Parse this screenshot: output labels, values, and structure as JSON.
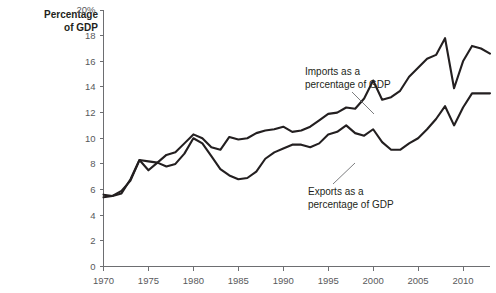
{
  "chart_data": {
    "type": "line",
    "title": "",
    "subtitle": "",
    "xlabel": "",
    "ylabel": "Percentage of GDP",
    "ylabel_line1": "Percentage",
    "ylabel_line2": "of GDP",
    "xlim": [
      1970,
      2013
    ],
    "ylim": [
      0,
      20
    ],
    "grid": false,
    "legend_position": "inline-annotations",
    "x_ticks": [
      1970,
      1975,
      1980,
      1985,
      1990,
      1995,
      2000,
      2005,
      2010
    ],
    "x_tick_labels": [
      "1970",
      "1975",
      "1980",
      "1985",
      "1990",
      "1995",
      "2000",
      "2005",
      "2010"
    ],
    "y_ticks": [
      0,
      2,
      4,
      6,
      8,
      10,
      12,
      14,
      16,
      18,
      20
    ],
    "y_tick_labels": [
      "0",
      "2",
      "4",
      "6",
      "8",
      "10",
      "12",
      "14",
      "16",
      "18",
      "20%"
    ],
    "x": [
      1970,
      1971,
      1972,
      1973,
      1974,
      1975,
      1976,
      1977,
      1978,
      1979,
      1980,
      1981,
      1982,
      1983,
      1984,
      1985,
      1986,
      1987,
      1988,
      1989,
      1990,
      1991,
      1992,
      1993,
      1994,
      1995,
      1996,
      1997,
      1998,
      1999,
      2000,
      2001,
      2002,
      2003,
      2004,
      2005,
      2006,
      2007,
      2008,
      2009,
      2010,
      2011,
      2012,
      2013
    ],
    "series": [
      {
        "name": "Imports as a percentage of GDP",
        "annotation_line1": "Imports as a",
        "annotation_line2": "percentage of GDP",
        "color": "#231f20",
        "values": [
          5.4,
          5.5,
          5.9,
          6.7,
          8.3,
          7.5,
          8.1,
          8.7,
          8.9,
          9.6,
          10.3,
          10.0,
          9.3,
          9.1,
          10.1,
          9.9,
          10.0,
          10.4,
          10.6,
          10.7,
          10.9,
          10.5,
          10.6,
          10.9,
          11.4,
          11.9,
          12.0,
          12.4,
          12.3,
          13.1,
          14.5,
          13.0,
          13.2,
          13.7,
          14.8,
          15.5,
          16.2,
          16.5,
          17.8,
          13.9,
          16.0,
          17.2,
          17.0,
          16.6
        ]
      },
      {
        "name": "Exports as a percentage of GDP",
        "annotation_line1": "Exports as a",
        "annotation_line2": "percentage of GDP",
        "color": "#231f20",
        "values": [
          5.6,
          5.5,
          5.7,
          6.8,
          8.3,
          8.2,
          8.1,
          7.8,
          8.0,
          8.8,
          10.0,
          9.6,
          8.6,
          7.6,
          7.1,
          6.8,
          6.9,
          7.4,
          8.4,
          8.9,
          9.2,
          9.5,
          9.5,
          9.3,
          9.6,
          10.3,
          10.5,
          11.0,
          10.4,
          10.2,
          10.7,
          9.7,
          9.1,
          9.1,
          9.6,
          10.0,
          10.7,
          11.5,
          12.5,
          11.0,
          12.4,
          13.5,
          13.5,
          13.5
        ]
      }
    ],
    "annotations": [
      {
        "id": "imports-annotation",
        "line1": "Imports as a",
        "line2": "percentage of GDP",
        "text_x": 305,
        "text_y": 75,
        "leader": {
          "x1": 352,
          "y1": 88,
          "x2": 372,
          "y2": 110
        }
      },
      {
        "id": "exports-annotation",
        "line1": "Exports as a",
        "line2": "percentage of GDP",
        "text_x": 308,
        "text_y": 192,
        "leader": {
          "x1": 336,
          "y1": 186,
          "x2": 356,
          "y2": 166
        }
      }
    ]
  }
}
